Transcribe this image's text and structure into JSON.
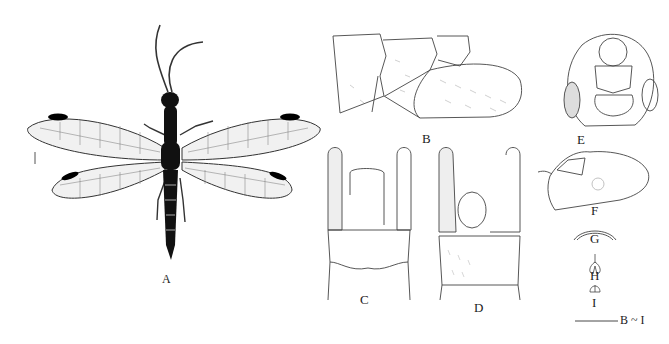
{
  "figure": {
    "panels": [
      {
        "id": "A",
        "label": "A",
        "description": "Adult habitus, dorsal view"
      },
      {
        "id": "B",
        "label": "B",
        "description": "Male terminalia, lateral view"
      },
      {
        "id": "C",
        "label": "C",
        "description": "Male terminalia, dorsal view"
      },
      {
        "id": "D",
        "label": "D",
        "description": "Male terminalia, ventral view"
      },
      {
        "id": "E",
        "label": "E",
        "description": "Male terminalia, caudal view"
      },
      {
        "id": "F",
        "label": "F",
        "description": "Female terminalia, lateral view"
      },
      {
        "id": "G",
        "label": "G",
        "description": "Structure G"
      },
      {
        "id": "H",
        "label": "H",
        "description": "Structure H"
      },
      {
        "id": "I",
        "label": "I",
        "description": "Structure I"
      }
    ],
    "scale_bar_label": "B ~ I",
    "colors": {
      "ink": "#222222",
      "background": "#ffffff",
      "wing_spot": "#000000"
    }
  }
}
